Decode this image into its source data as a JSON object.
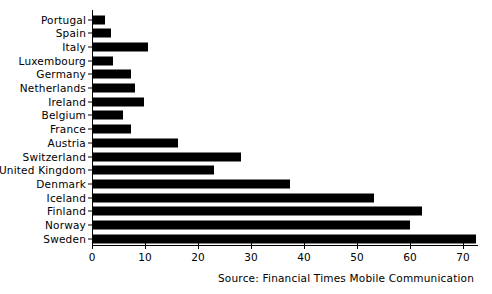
{
  "chart_data": {
    "type": "bar",
    "orientation": "horizontal",
    "title": "",
    "subtitle": "",
    "xlabel": "",
    "ylabel": "",
    "xlim": [
      0,
      75
    ],
    "grid": false,
    "legend": null,
    "categories": [
      "Portugal",
      "Spain",
      "Italy",
      "Luxembourg",
      "Germany",
      "Netherlands",
      "Ireland",
      "Belgium",
      "France",
      "Austria",
      "Switzerland",
      "United Kingdom",
      "Denmark",
      "Iceland",
      "Finland",
      "Norway",
      "Sweden"
    ],
    "values": [
      2.4,
      3.6,
      10.6,
      4.0,
      7.4,
      8.2,
      9.8,
      5.8,
      7.3,
      16.2,
      28.2,
      23.0,
      37.3,
      53.2,
      62.2,
      60.0,
      72.5
    ],
    "xticks": [
      0,
      10,
      20,
      30,
      40,
      50,
      60,
      70
    ],
    "xticklabels": [
      "0",
      "10",
      "20",
      "30",
      "40",
      "50",
      "60",
      "70"
    ],
    "bar_color": "#000000",
    "background_color": "#ffffff",
    "annotations": [
      "Source: Financial Times Mobile Communication"
    ]
  },
  "source": {
    "text": "Source: Financial Times Mobile Communication"
  }
}
